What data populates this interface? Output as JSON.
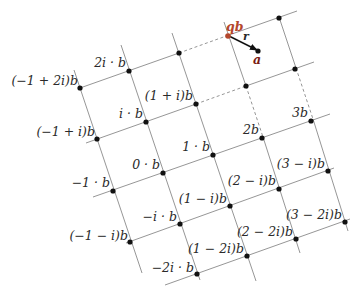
{
  "diagram": {
    "type": "gaussian-integer-lattice",
    "origin_px": [
      163,
      173
    ],
    "basis_one_px": [
      50,
      -18
    ],
    "basis_i_px": [
      -17,
      -51
    ],
    "colors": {
      "grid": "#8a8a8a",
      "dot": "#111111",
      "qb": "#b4472c",
      "a": "#7a1a12",
      "arrow": "#111111",
      "label": "#2a2a2a"
    },
    "labels": {
      "p_m1_2": "(−1 + 2i)b",
      "p_0_2": "2i · b",
      "p_m1_1": "(−1 + i)b",
      "p_0_1": "i · b",
      "p_1_1": "(1 + i)b",
      "p_m1_0": "−1 · b",
      "p_0_0": "0 · b",
      "p_1_0": "1 · b",
      "p_2_0": "2b",
      "p_3_0": "3b",
      "p_m1_m1": "(−1 − i)b",
      "p_0_m1": "−i · b",
      "p_1_m1": "(1 − i)b",
      "p_2_m1": "(2 − i)b",
      "p_3_m1": "(3 − i)b",
      "p_0_m2": "−2i · b",
      "p_1_m2": "(1 − 2i)b",
      "p_2_m2": "(2 − 2i)b",
      "p_3_m2": "(3 − 2i)b",
      "qb": "qb",
      "a": "a",
      "r": "r"
    }
  }
}
